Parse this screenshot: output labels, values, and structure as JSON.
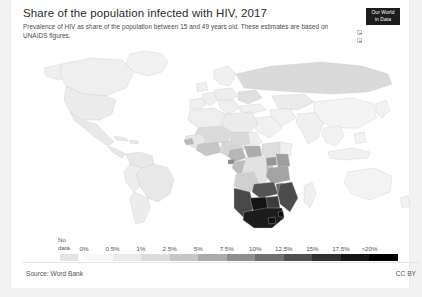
{
  "header": {
    "title": "Share of the population infected with HIV, 2017",
    "subtitle": "Prevalence of HIV as share of the population between 15 and 49 years old. These estimates are based on UNAIDS figures."
  },
  "logo": {
    "line1": "Our World",
    "line2": "in Data"
  },
  "map_controls": [
    {
      "name": "zoom-in-control"
    },
    {
      "name": "zoom-out-control"
    }
  ],
  "legend": {
    "no_data_label_line1": "No",
    "no_data_label_line2": "data",
    "no_data_color": "#e4e4e4",
    "ticks": [
      "0%",
      "0.5%",
      "1%",
      "2.5%",
      "5%",
      "7.5%",
      "10%",
      "12.5%",
      "15%",
      "17.5%",
      ">20%"
    ],
    "colors": [
      "#f7f7f7",
      "#ebebeb",
      "#dcdcdc",
      "#c6c6c6",
      "#ababab",
      "#8f8f8f",
      "#6f6f6f",
      "#4f4f4f",
      "#303030",
      "#151515",
      "#000000"
    ]
  },
  "footer": {
    "source": "Source: Word Bank",
    "license": "CC BY"
  },
  "chart_data": {
    "type": "map",
    "title": "Share of the population infected with HIV, 2017",
    "subtitle": "Prevalence of HIV as share of the population between 15 and 49 years old. These estimates are based on UNAIDS figures.",
    "unit": "percent of population aged 15-49",
    "projection": "world-equirectangular",
    "legend_breaks": [
      "0%",
      "0.5%",
      "1%",
      "2.5%",
      "5%",
      "7.5%",
      "10%",
      "12.5%",
      "15%",
      "17.5%",
      ">20%"
    ],
    "no_data_category": "No data",
    "source": "Source: Word Bank",
    "license": "CC BY",
    "regions": [
      {
        "name": "Eswatini",
        "value": 27.4,
        "shade": "#080808"
      },
      {
        "name": "Lesotho",
        "value": 23.8,
        "shade": "#0d0d0d"
      },
      {
        "name": "Botswana",
        "value": 22.8,
        "shade": "#141414"
      },
      {
        "name": "South Africa",
        "value": 18.8,
        "shade": "#1c1c1c"
      },
      {
        "name": "Zimbabwe",
        "value": 13.3,
        "shade": "#3c3c3c"
      },
      {
        "name": "Namibia",
        "value": 12.6,
        "shade": "#484848"
      },
      {
        "name": "Zambia",
        "value": 11.5,
        "shade": "#545454"
      },
      {
        "name": "Mozambique",
        "value": 12.5,
        "shade": "#4c4c4c"
      },
      {
        "name": "Malawi",
        "value": 9.6,
        "shade": "#646464"
      },
      {
        "name": "Equatorial Guinea",
        "value": 6.5,
        "shade": "#8a8a8a"
      },
      {
        "name": "Tanzania",
        "value": 4.5,
        "shade": "#a3a3a3"
      },
      {
        "name": "Uganda",
        "value": 5.9,
        "shade": "#959595"
      },
      {
        "name": "Kenya",
        "value": 4.8,
        "shade": "#9e9e9e"
      },
      {
        "name": "Central African Republic",
        "value": 4.0,
        "shade": "#adadad"
      },
      {
        "name": "Gabon",
        "value": 3.6,
        "shade": "#b4b4b4"
      },
      {
        "name": "Cameroon",
        "value": 3.6,
        "shade": "#b6b6b6"
      },
      {
        "name": "Congo",
        "value": 3.1,
        "shade": "#bdbdbd"
      },
      {
        "name": "Guinea-Bissau",
        "value": 3.4,
        "shade": "#b8b8b8"
      },
      {
        "name": "Côte d'Ivoire",
        "value": 2.8,
        "shade": "#c2c2c2"
      },
      {
        "name": "Angola",
        "value": 1.9,
        "shade": "#cfcfcf"
      },
      {
        "name": "Nigeria",
        "value": 1.5,
        "shade": "#d6d6d6"
      },
      {
        "name": "Ethiopia",
        "value": 1.0,
        "shade": "#dedede"
      },
      {
        "name": "Ghana",
        "value": 1.7,
        "shade": "#d2d2d2"
      },
      {
        "name": "Rwanda",
        "value": 2.7,
        "shade": "#c4c4c4"
      },
      {
        "name": "Burundi",
        "value": 1.0,
        "shade": "#dcdcdc"
      },
      {
        "name": "Chad",
        "value": 1.3,
        "shade": "#d9d9d9"
      },
      {
        "name": "Democratic Republic of Congo",
        "value": 0.7,
        "shade": "#e2e2e2"
      },
      {
        "name": "Sudan",
        "value": 0.2,
        "shade": "#eeeeee"
      },
      {
        "name": "Mali",
        "value": 1.1,
        "shade": "#dbdbdb"
      },
      {
        "name": "Senegal",
        "value": 0.4,
        "shade": "#e9e9e9"
      },
      {
        "name": "Russia",
        "value": 1.1,
        "shade": "#dadada"
      },
      {
        "name": "Ukraine",
        "value": 0.9,
        "shade": "#dfdfdf"
      },
      {
        "name": "Brazil",
        "value": 0.5,
        "shade": "#e8e8e8"
      },
      {
        "name": "United States",
        "value": 0.4,
        "shade": "#ececec"
      },
      {
        "name": "India",
        "value": 0.2,
        "shade": "#f0f0f0"
      },
      {
        "name": "China",
        "value": 0.1,
        "shade": "#f4f4f4"
      },
      {
        "name": "Australia",
        "value": 0.1,
        "shade": "#f3f3f3"
      },
      {
        "name": "Canada",
        "value": 0.2,
        "shade": "#efefef"
      }
    ]
  }
}
